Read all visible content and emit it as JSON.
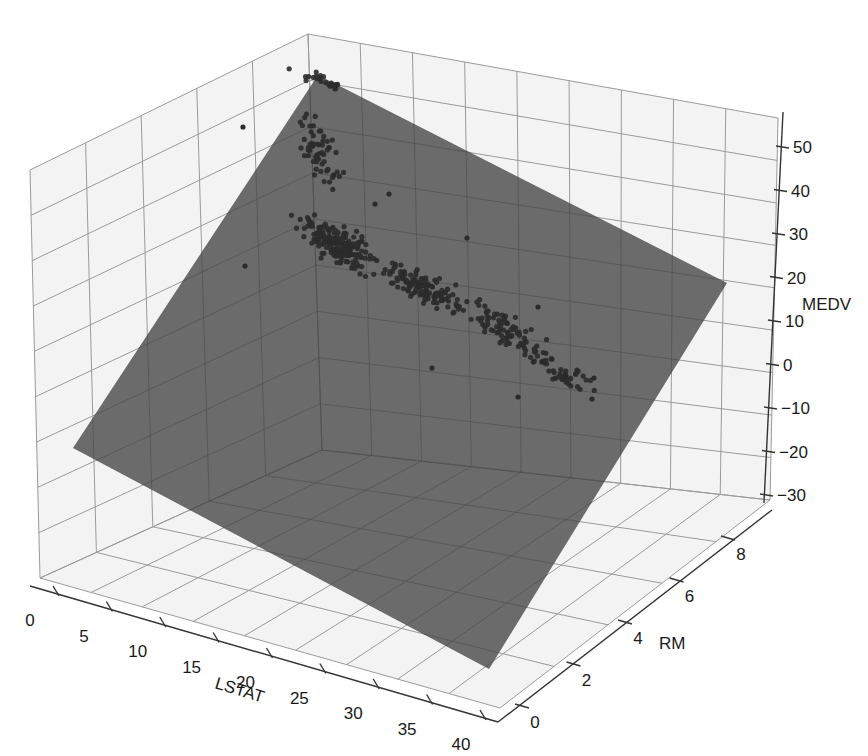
{
  "chart_data": {
    "type": "scatter3d",
    "title": "",
    "xlabel": "LSTAT",
    "ylabel": "RM",
    "zlabel": "MEDV",
    "xlim": [
      0,
      40
    ],
    "ylim": [
      0,
      9
    ],
    "zlim": [
      -30,
      55
    ],
    "x_ticks": [
      0,
      5,
      10,
      15,
      20,
      25,
      30,
      35,
      40
    ],
    "y_ticks": [
      0,
      2,
      4,
      6,
      8
    ],
    "z_ticks": [
      50,
      40,
      30,
      20,
      10,
      0,
      -10,
      -20,
      -30
    ],
    "grid": true,
    "legend": null,
    "colors": {
      "points": "#2b2b2b",
      "plane": "#6b6b6b",
      "pane": "#f3f3f3",
      "grid": "#9a9a9a"
    },
    "series": [
      {
        "name": "observations",
        "kind": "scatter",
        "count_approx": 506,
        "points_screen_clusters": [
          {
            "label": "high-value cap (MEDV ~50)",
            "cx": 322,
            "cy": 80,
            "rx": 40,
            "ry": 12,
            "n": 22
          },
          {
            "label": "upper tail",
            "cx": 318,
            "cy": 150,
            "rx": 30,
            "ry": 55,
            "n": 60
          },
          {
            "label": "dense core",
            "cx": 340,
            "cy": 245,
            "rx": 55,
            "ry": 30,
            "n": 170
          },
          {
            "label": "mid band",
            "cx": 420,
            "cy": 285,
            "rx": 60,
            "ry": 28,
            "n": 120
          },
          {
            "label": "lower band",
            "cx": 505,
            "cy": 330,
            "rx": 60,
            "ry": 30,
            "n": 80
          },
          {
            "label": "low-value tail",
            "cx": 565,
            "cy": 375,
            "rx": 40,
            "ry": 22,
            "n": 40
          }
        ],
        "outliers_screen": [
          [
            243,
            127
          ],
          [
            245,
            266
          ],
          [
            389,
            194
          ],
          [
            467,
            238
          ],
          [
            538,
            307
          ],
          [
            594,
            378
          ],
          [
            592,
            399
          ],
          [
            432,
            368
          ],
          [
            375,
            204
          ],
          [
            518,
            397
          ]
        ]
      },
      {
        "name": "regression plane",
        "kind": "surface",
        "corners_data": [
          {
            "LSTAT": 0,
            "RM": 0,
            "MEDV": -20
          },
          {
            "LSTAT": 0,
            "RM": 9,
            "MEDV": 55
          },
          {
            "LSTAT": 40,
            "RM": 9,
            "MEDV": 20
          },
          {
            "LSTAT": 40,
            "RM": 0,
            "MEDV": -28
          }
        ],
        "corners_screen": [
          [
            73,
            448
          ],
          [
            318,
            75
          ],
          [
            727,
            283
          ],
          [
            489,
            669
          ]
        ]
      }
    ]
  },
  "axes": {
    "x": {
      "label": "LSTAT",
      "ticks": [
        "0",
        "5",
        "10",
        "15",
        "20",
        "25",
        "30",
        "35",
        "40"
      ]
    },
    "y": {
      "label": "RM",
      "ticks": [
        "0",
        "2",
        "4",
        "6",
        "8"
      ]
    },
    "z": {
      "label": "MEDV",
      "ticks": [
        "50",
        "40",
        "30",
        "20",
        "10",
        "0",
        "-10",
        "-20",
        "-30"
      ]
    }
  }
}
